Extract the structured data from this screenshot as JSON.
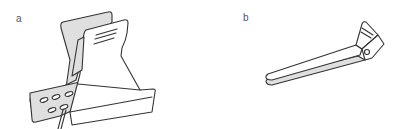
{
  "figure": {
    "panels": [
      {
        "label": "a",
        "subject": "clip-holder-illustration"
      },
      {
        "label": "b",
        "subject": "hair-clip-illustration"
      }
    ]
  }
}
